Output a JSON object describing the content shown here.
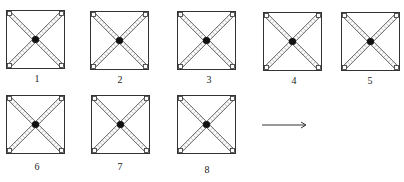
{
  "figures": [
    {
      "label": "1",
      "x": 6,
      "y": 10,
      "lx": 27,
      "ly": 73
    },
    {
      "label": "2",
      "x": 90,
      "y": 11,
      "lx": 110,
      "ly": 74
    },
    {
      "label": "3",
      "x": 177,
      "y": 11,
      "lx": 199,
      "ly": 74
    },
    {
      "label": "4",
      "x": 263,
      "y": 12,
      "lx": 284,
      "ly": 75
    },
    {
      "label": "5",
      "x": 341,
      "y": 12,
      "lx": 360,
      "ly": 75
    },
    {
      "label": "6",
      "x": 6,
      "y": 95,
      "lx": 27,
      "ly": 161
    },
    {
      "label": "7",
      "x": 91,
      "y": 95,
      "lx": 110,
      "ly": 161
    },
    {
      "label": "8",
      "x": 177,
      "y": 95,
      "lx": 197,
      "ly": 164
    }
  ],
  "arrow": {
    "x1": 262,
    "x2": 306,
    "y": 121,
    "direction": "right"
  },
  "colors": {
    "stroke": "#333333",
    "center": "#111111",
    "hatch": "#888888"
  }
}
